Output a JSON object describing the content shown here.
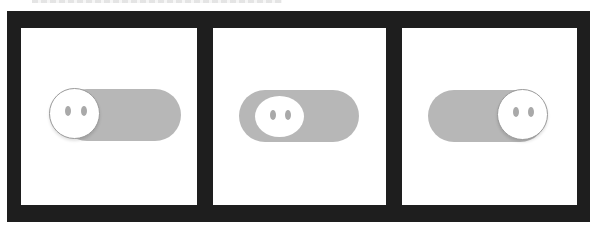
{
  "figure": {
    "panels": [
      {
        "id": "panel-1",
        "state": "off",
        "knob_position": "left",
        "knob_style": "bordered-circle-outside-track"
      },
      {
        "id": "panel-2",
        "state": "transition",
        "knob_position": "left-inset",
        "knob_style": "oval-inside-track"
      },
      {
        "id": "panel-3",
        "state": "on",
        "knob_position": "right",
        "knob_style": "bordered-circle-outside-track"
      }
    ],
    "colors": {
      "frame": "#1e1e1e",
      "panel_background": "#ffffff",
      "track": "#b7b7b7",
      "knob": "#ffffff",
      "knob_border": "#9a9a9a",
      "eyes": "#a9a9a9"
    }
  }
}
